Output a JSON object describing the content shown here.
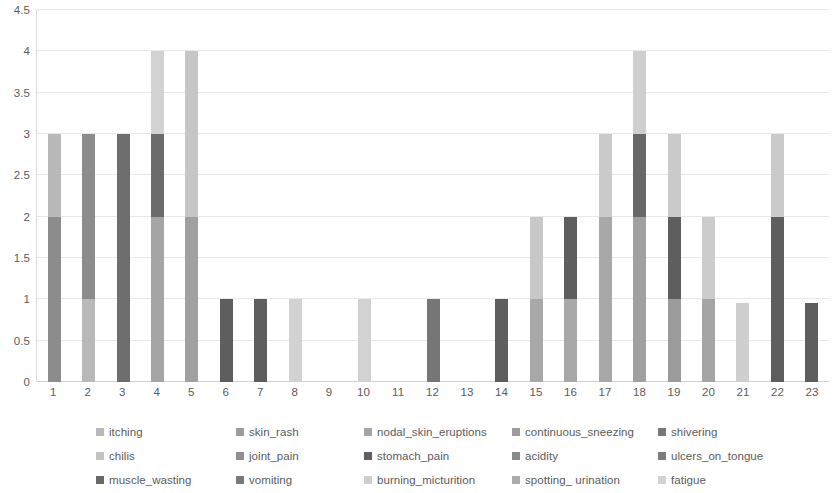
{
  "chart_data": {
    "type": "bar",
    "subtype": "stacked-column",
    "title": "",
    "xlabel": "",
    "ylabel": "",
    "ylim": [
      0,
      4.5
    ],
    "ytick_values": [
      0,
      0.5,
      1,
      1.5,
      2,
      2.5,
      3,
      3.5,
      4,
      4.5
    ],
    "ytick_labels": [
      "0",
      "0.5",
      "1",
      "1.5",
      "2",
      "2.5",
      "3",
      "3.5",
      "4",
      "4.5"
    ],
    "grid": true,
    "legend_position": "bottom",
    "categories": [
      "1",
      "2",
      "3",
      "4",
      "5",
      "6",
      "7",
      "8",
      "9",
      "10",
      "11",
      "12",
      "13",
      "14",
      "15",
      "16",
      "17",
      "18",
      "19",
      "20",
      "21",
      "22",
      "23"
    ],
    "series": [
      {
        "name": "itching",
        "color": "#b9b9b9",
        "values": [
          1,
          1,
          0,
          2,
          2,
          0,
          0,
          0,
          0,
          0,
          0,
          0,
          0,
          0,
          1,
          1,
          2,
          2,
          1,
          1,
          0,
          2,
          0
        ]
      },
      {
        "name": "skin_rash",
        "color": "#8c8c8c",
        "values": [
          2,
          2,
          0,
          0,
          2,
          0,
          0,
          0,
          0,
          0,
          0,
          0,
          0,
          0,
          1,
          1,
          1,
          1,
          1,
          1,
          0,
          0,
          0
        ]
      },
      {
        "name": "nodal_skin_eruptions",
        "color": "#a5a5a5",
        "values": [
          0,
          0,
          3,
          0,
          0,
          0,
          0,
          0,
          0,
          0,
          0,
          0,
          0,
          0,
          0,
          0,
          0,
          0,
          0,
          0,
          0,
          0,
          0
        ]
      },
      {
        "name": "continuous_sneezing",
        "color": "#9d9d9d",
        "values": [
          0,
          0,
          0,
          0,
          0,
          0,
          0,
          0,
          0,
          0,
          0,
          0,
          0,
          0,
          0,
          0,
          0,
          0,
          0,
          0,
          0,
          0,
          0
        ]
      },
      {
        "name": "shivering",
        "color": "#767676",
        "values": [
          0,
          0,
          0,
          1,
          0,
          0,
          0,
          0,
          0,
          0,
          0,
          0,
          0,
          0,
          0,
          0,
          0,
          0,
          0,
          0,
          0,
          0,
          0
        ]
      },
      {
        "name": "chilis",
        "color": "#c4c4c4",
        "values": [
          0,
          0,
          0,
          0,
          0,
          0,
          0,
          0,
          0,
          0,
          0,
          0,
          0,
          0,
          0,
          0,
          0,
          0,
          0,
          0,
          0,
          0,
          0
        ]
      },
      {
        "name": "joint_pain",
        "color": "#8f8f8f",
        "values": [
          0,
          0,
          0,
          0,
          0,
          0,
          0,
          0,
          0,
          0,
          0,
          0,
          0,
          0,
          0,
          0,
          0,
          0,
          0,
          0,
          0,
          0,
          0
        ]
      },
      {
        "name": "stomach_pain",
        "color": "#5e5e5e",
        "values": [
          0,
          0,
          0,
          0,
          0,
          1,
          1,
          0,
          0,
          0,
          0,
          1,
          0,
          1,
          0,
          1,
          0,
          1,
          1,
          0,
          0,
          2,
          0.95
        ]
      },
      {
        "name": "acidity",
        "color": "#8a8a8a",
        "values": [
          0,
          0,
          0,
          0,
          0,
          0,
          0,
          0,
          0,
          0,
          0,
          0,
          0,
          0,
          0,
          0,
          0,
          0,
          0,
          0,
          0,
          0,
          0
        ]
      },
      {
        "name": "ulcers_on_tongue",
        "color": "#7d7d7d",
        "values": [
          0,
          0,
          0,
          0,
          0,
          0,
          0,
          0,
          0,
          0,
          0,
          0,
          0,
          0,
          0,
          0,
          0,
          0,
          0,
          0,
          0,
          0,
          0
        ]
      },
      {
        "name": "muscle_wasting",
        "color": "#686868",
        "values": [
          0,
          0,
          0,
          0,
          0,
          0,
          0,
          0,
          0,
          0,
          0,
          0,
          0,
          0,
          0,
          0,
          0,
          0,
          0,
          0,
          0,
          0,
          0
        ]
      },
      {
        "name": "vomiting",
        "color": "#7a7a7a",
        "values": [
          0,
          0,
          0,
          0,
          0,
          0,
          0,
          0,
          0,
          0,
          0,
          0,
          0,
          0,
          0,
          0,
          0,
          0,
          0,
          0,
          0,
          0,
          0
        ]
      },
      {
        "name": "burning_micturition",
        "color": "#cfcfcf",
        "values": [
          0,
          0,
          0,
          0,
          0,
          0,
          0,
          0,
          0,
          0,
          0,
          0,
          0,
          0,
          0,
          0,
          0,
          0,
          0,
          0,
          0,
          0,
          0
        ]
      },
      {
        "name": "spotting_ urination",
        "color": "#aaaaaa",
        "values": [
          0,
          0,
          0,
          0,
          0,
          0,
          0,
          0,
          0,
          0,
          0,
          0,
          0,
          0,
          0,
          0,
          0,
          0,
          0,
          0,
          0,
          0,
          0
        ]
      },
      {
        "name": "fatigue",
        "color": "#d2d2d2",
        "values": [
          0,
          0,
          0,
          1,
          0,
          0,
          0,
          1,
          0,
          1,
          0,
          0,
          0,
          0,
          0,
          0,
          0,
          1,
          1,
          0,
          0.95,
          1,
          0
        ]
      }
    ],
    "bar_totals": [
      3,
      3,
      3,
      4,
      4,
      1,
      1,
      1,
      0,
      1,
      0,
      1,
      0,
      1,
      2,
      2,
      3,
      4,
      3,
      2,
      0.95,
      3,
      0.95
    ],
    "stacks": [
      {
        "category": "1",
        "segments": [
          {
            "series": "skin_rash",
            "value": 2,
            "color": "#8c8c8c"
          },
          {
            "series": "itching",
            "value": 1,
            "color": "#b9b9b9"
          }
        ]
      },
      {
        "category": "2",
        "segments": [
          {
            "series": "itching",
            "value": 1,
            "color": "#b9b9b9"
          },
          {
            "series": "skin_rash",
            "value": 2,
            "color": "#8c8c8c"
          }
        ]
      },
      {
        "category": "3",
        "segments": [
          {
            "series": "nodal_skin_eruptions",
            "value": 3,
            "color": "#6e6e6e"
          }
        ]
      },
      {
        "category": "4",
        "segments": [
          {
            "series": "skin_rash",
            "value": 2,
            "color": "#a5a5a5"
          },
          {
            "series": "shivering",
            "value": 1,
            "color": "#6b6b6b"
          },
          {
            "series": "fatigue",
            "value": 1,
            "color": "#d2d2d2"
          }
        ]
      },
      {
        "category": "5",
        "segments": [
          {
            "series": "skin_rash",
            "value": 2,
            "color": "#a0a0a0"
          },
          {
            "series": "itching",
            "value": 2,
            "color": "#c6c6c6"
          }
        ]
      },
      {
        "category": "6",
        "segments": [
          {
            "series": "stomach_pain",
            "value": 1,
            "color": "#5e5e5e"
          }
        ]
      },
      {
        "category": "7",
        "segments": [
          {
            "series": "stomach_pain",
            "value": 1,
            "color": "#5e5e5e"
          }
        ]
      },
      {
        "category": "8",
        "segments": [
          {
            "series": "fatigue",
            "value": 1,
            "color": "#d2d2d2"
          }
        ]
      },
      {
        "category": "9",
        "segments": []
      },
      {
        "category": "10",
        "segments": [
          {
            "series": "fatigue",
            "value": 1,
            "color": "#d2d2d2"
          }
        ]
      },
      {
        "category": "11",
        "segments": []
      },
      {
        "category": "12",
        "segments": [
          {
            "series": "stomach_pain",
            "value": 1,
            "color": "#767676"
          }
        ]
      },
      {
        "category": "13",
        "segments": []
      },
      {
        "category": "14",
        "segments": [
          {
            "series": "stomach_pain",
            "value": 1,
            "color": "#5e5e5e"
          }
        ]
      },
      {
        "category": "15",
        "segments": [
          {
            "series": "skin_rash",
            "value": 1,
            "color": "#a8a8a8"
          },
          {
            "series": "itching",
            "value": 1,
            "color": "#c8c8c8"
          }
        ]
      },
      {
        "category": "16",
        "segments": [
          {
            "series": "skin_rash",
            "value": 1,
            "color": "#a8a8a8"
          },
          {
            "series": "stomach_pain",
            "value": 1,
            "color": "#5e5e5e"
          }
        ]
      },
      {
        "category": "17",
        "segments": [
          {
            "series": "skin_rash",
            "value": 2,
            "color": "#a8a8a8"
          },
          {
            "series": "itching",
            "value": 1,
            "color": "#cacaca"
          }
        ]
      },
      {
        "category": "18",
        "segments": [
          {
            "series": "skin_rash",
            "value": 2,
            "color": "#a0a0a0"
          },
          {
            "series": "stomach_pain",
            "value": 1,
            "color": "#686868"
          },
          {
            "series": "fatigue",
            "value": 1,
            "color": "#cfcfcf"
          }
        ]
      },
      {
        "category": "19",
        "segments": [
          {
            "series": "skin_rash",
            "value": 1,
            "color": "#9b9b9b"
          },
          {
            "series": "stomach_pain",
            "value": 1,
            "color": "#5e5e5e"
          },
          {
            "series": "fatigue",
            "value": 1,
            "color": "#cacaca"
          }
        ]
      },
      {
        "category": "20",
        "segments": [
          {
            "series": "skin_rash",
            "value": 1,
            "color": "#a5a5a5"
          },
          {
            "series": "itching",
            "value": 1,
            "color": "#cccccc"
          }
        ]
      },
      {
        "category": "21",
        "segments": [
          {
            "series": "fatigue",
            "value": 0.95,
            "color": "#cfcfcf"
          }
        ]
      },
      {
        "category": "22",
        "segments": [
          {
            "series": "stomach_pain",
            "value": 2,
            "color": "#5e5e5e"
          },
          {
            "series": "fatigue",
            "value": 1,
            "color": "#cacaca"
          }
        ]
      },
      {
        "category": "23",
        "segments": [
          {
            "series": "stomach_pain",
            "value": 0.95,
            "color": "#5e5e5e"
          }
        ]
      }
    ]
  },
  "legend": {
    "items": [
      {
        "label": "itching",
        "color": "#b9b9b9"
      },
      {
        "label": "skin_rash",
        "color": "#9a9a9a"
      },
      {
        "label": "nodal_skin_eruptions",
        "color": "#a5a5a5"
      },
      {
        "label": "continuous_sneezing",
        "color": "#9d9d9d"
      },
      {
        "label": "shivering",
        "color": "#767676"
      },
      {
        "label": "chilis",
        "color": "#c4c4c4"
      },
      {
        "label": "joint_pain",
        "color": "#8f8f8f"
      },
      {
        "label": "stomach_pain",
        "color": "#5e5e5e"
      },
      {
        "label": "acidity",
        "color": "#8a8a8a"
      },
      {
        "label": "ulcers_on_tongue",
        "color": "#7d7d7d"
      },
      {
        "label": "muscle_wasting",
        "color": "#686868"
      },
      {
        "label": "vomiting",
        "color": "#7a7a7a"
      },
      {
        "label": "burning_micturition",
        "color": "#cfcfcf"
      },
      {
        "label": "spotting_ urination",
        "color": "#aaaaaa"
      },
      {
        "label": "fatigue",
        "color": "#d2d2d2"
      }
    ]
  }
}
